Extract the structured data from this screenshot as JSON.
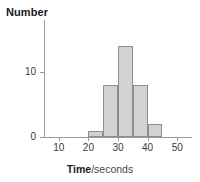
{
  "chart_data": {
    "type": "bar",
    "title": "",
    "xlabel_bold": "Time",
    "xlabel_plain": "/seconds",
    "ylabel": "Number",
    "categories": [
      "20-25",
      "25-30",
      "30-35",
      "35-40",
      "40-45"
    ],
    "bin_edges": [
      20,
      25,
      30,
      35,
      40,
      45
    ],
    "values": [
      1,
      8,
      14,
      8,
      2
    ],
    "xlim": [
      5,
      55
    ],
    "ylim": [
      0,
      16
    ],
    "x_ticks": [
      10,
      20,
      30,
      40,
      50
    ],
    "x_tick_labels": [
      "10",
      "20",
      "30",
      "40",
      "50"
    ],
    "y_ticks": [
      0,
      10
    ],
    "y_tick_labels": [
      "0",
      "10"
    ],
    "grid": false,
    "legend": "none",
    "bar_fill_color": "#d2d2d2",
    "bar_edge_color": "#8e8e8e",
    "axis_color": "#9a9a9a"
  }
}
